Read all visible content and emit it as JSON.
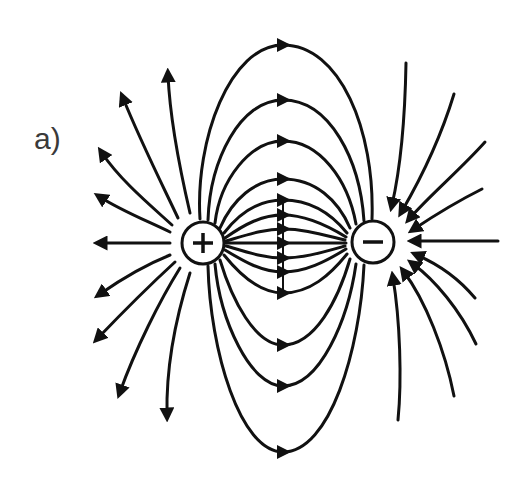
{
  "figure": {
    "panel_label": "a)",
    "colors": {
      "ink": "#111111",
      "background": "#ffffff",
      "label": "#3a3a3a"
    }
  },
  "charges": [
    {
      "name": "positive-charge",
      "sign": "+",
      "cx": 203,
      "cy": 243,
      "r": 21
    },
    {
      "name": "negative-charge",
      "sign": "−",
      "cx": 373,
      "cy": 242,
      "r": 21
    }
  ],
  "field_lines": {
    "midline_x": 283,
    "between_charges_arrow_y": [
      45,
      100,
      141,
      179,
      200,
      215,
      229,
      243,
      258,
      272,
      293,
      345,
      386,
      452
    ],
    "left_outward_count": 9,
    "right_inward_count": 9
  }
}
